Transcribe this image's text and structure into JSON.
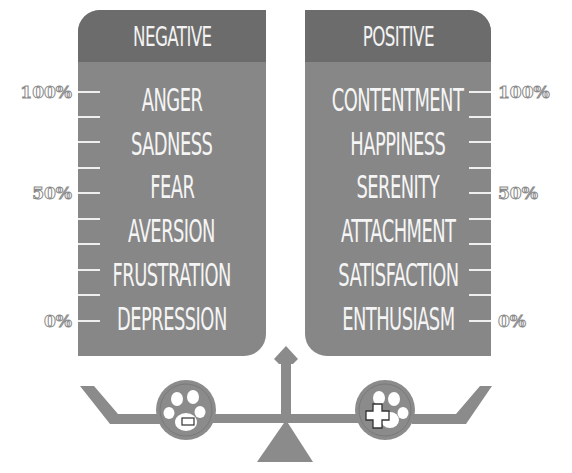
{
  "panels": {
    "negative": {
      "title": "NEGATIVE",
      "emotions": [
        "ANGER",
        "SADNESS",
        "FEAR",
        "AVERSION",
        "FRUSTRATION",
        "DEPRESSION"
      ]
    },
    "positive": {
      "title": "POSITIVE",
      "emotions": [
        "CONTENTMENT",
        "HAPPINESS",
        "SERENITY",
        "ATTACHMENT",
        "SATISFACTION",
        "ENTHUSIASM"
      ]
    }
  },
  "scale": {
    "labels": [
      "100%",
      "50%",
      "0%"
    ],
    "tick_count": 10
  },
  "balance": {
    "left_icon": "paw-minus-icon",
    "right_icon": "paw-plus-icon"
  },
  "colors": {
    "panel_header": "#6c6c6c",
    "panel_body": "#878787",
    "text": "#f5f5f5",
    "scale": "#8b8b8b"
  }
}
